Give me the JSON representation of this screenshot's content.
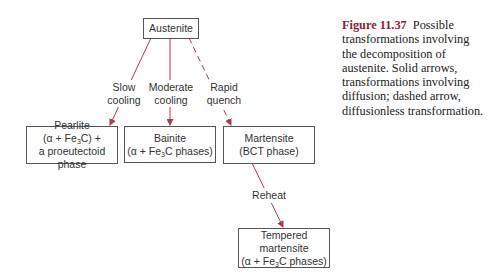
{
  "diagram": {
    "nodes": {
      "austenite": {
        "label": "Austenite"
      },
      "pearlite": {
        "line1": "Pearlite",
        "line2_pre": "(α + Fe",
        "line2_sub": "3",
        "line2_post": "C) +",
        "line3": "a proeutectoid phase"
      },
      "bainite": {
        "line1": "Bainite",
        "line2_pre": "(α + Fe",
        "line2_sub": "3",
        "line2_post": "C phases)"
      },
      "martensite": {
        "line1": "Martensite",
        "line2": "(BCT phase)"
      },
      "tempered": {
        "line1": "Tempered martensite",
        "line2_pre": "(α + Fe",
        "line2_sub": "3",
        "line2_post": "C phases)"
      }
    },
    "edges": [
      {
        "from": "austenite",
        "to": "pearlite",
        "label_line1": "Slow",
        "label_line2": "cooling",
        "style": "solid"
      },
      {
        "from": "austenite",
        "to": "bainite",
        "label_line1": "Moderate",
        "label_line2": "cooling",
        "style": "solid"
      },
      {
        "from": "austenite",
        "to": "martensite",
        "label_line1": "Rapid",
        "label_line2": "quench",
        "style": "dashed"
      },
      {
        "from": "martensite",
        "to": "tempered",
        "label_line1": "Reheat",
        "style": "solid"
      }
    ],
    "arrow_color": "#a8404f"
  },
  "caption": {
    "figure_label": "Figure 11.37",
    "text": "Possible transformations involving the decomposition of austenite. Solid arrows, transformations involving diffusion; dashed arrow, diffusionless transformation."
  }
}
